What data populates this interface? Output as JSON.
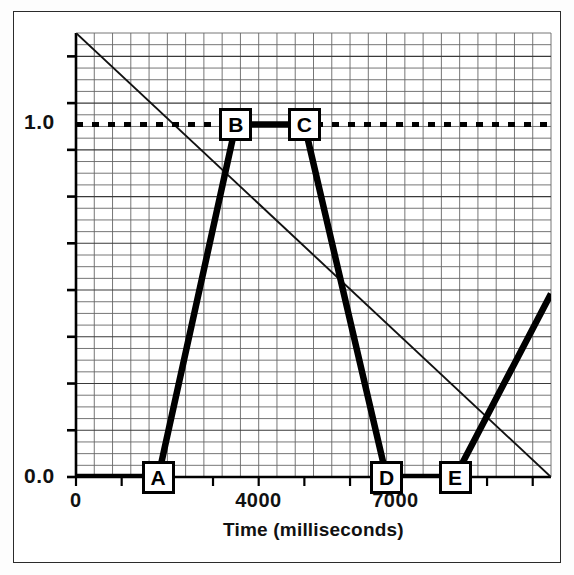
{
  "figure": {
    "title": "",
    "axis_label_x": "Time (milliseconds)",
    "axis_label_y": ""
  },
  "axes": {
    "x_ticks": [
      {
        "label": "0",
        "value": 0
      },
      {
        "label": "4000",
        "value": 4000
      },
      {
        "label": "7000",
        "value": 7000
      }
    ],
    "y_ticks": [
      {
        "label": "0.0",
        "value": 0.0
      },
      {
        "label": "1.0",
        "value": 1.0
      }
    ]
  },
  "markers": [
    {
      "id": "A",
      "label": "A",
      "x": 1800,
      "y": 0.0
    },
    {
      "id": "B",
      "label": "B",
      "x": 3500,
      "y": 1.0
    },
    {
      "id": "C",
      "label": "C",
      "x": 5000,
      "y": 1.0
    },
    {
      "id": "D",
      "label": "D",
      "x": 6800,
      "y": 0.0
    },
    {
      "id": "E",
      "label": "E",
      "x": 8300,
      "y": 0.0
    }
  ],
  "colors": {
    "ink": "#000000",
    "grid": "#555555",
    "frame": "#2b2b2b",
    "background": "#ffffff"
  },
  "chart_data": {
    "type": "line",
    "title": "",
    "xlabel": "Time (milliseconds)",
    "ylabel": "",
    "xlim": [
      0,
      10400
    ],
    "ylim": [
      0.0,
      1.26
    ],
    "grid": true,
    "legend": "none",
    "x_tick_values": [
      0,
      4000,
      7000
    ],
    "x_tick_labels": [
      "0",
      "4000",
      "7000"
    ],
    "y_tick_values": [
      0.0,
      1.0
    ],
    "y_tick_labels": [
      "0.0",
      "1.0"
    ],
    "series": [
      {
        "name": "signal",
        "style": "solid-thick",
        "points": [
          {
            "x": 0,
            "y": 0.0
          },
          {
            "x": 1800,
            "y": 0.0
          },
          {
            "x": 3500,
            "y": 1.0
          },
          {
            "x": 5000,
            "y": 1.0
          },
          {
            "x": 6800,
            "y": 0.0
          },
          {
            "x": 8300,
            "y": 0.0
          },
          {
            "x": 10400,
            "y": 0.52
          }
        ]
      },
      {
        "name": "threshold",
        "style": "dotted",
        "points": [
          {
            "x": 0,
            "y": 1.0
          },
          {
            "x": 10400,
            "y": 1.0
          }
        ]
      },
      {
        "name": "ramp",
        "style": "solid-thin",
        "points": [
          {
            "x": 0,
            "y": 1.26
          },
          {
            "x": 10400,
            "y": 0.0
          }
        ]
      }
    ],
    "annotations": [
      {
        "text": "A",
        "x": 1800,
        "y": 0.0
      },
      {
        "text": "B",
        "x": 3500,
        "y": 1.0
      },
      {
        "text": "C",
        "x": 5000,
        "y": 1.0
      },
      {
        "text": "D",
        "x": 6800,
        "y": 0.0
      },
      {
        "text": "E",
        "x": 8300,
        "y": 0.0
      }
    ]
  }
}
